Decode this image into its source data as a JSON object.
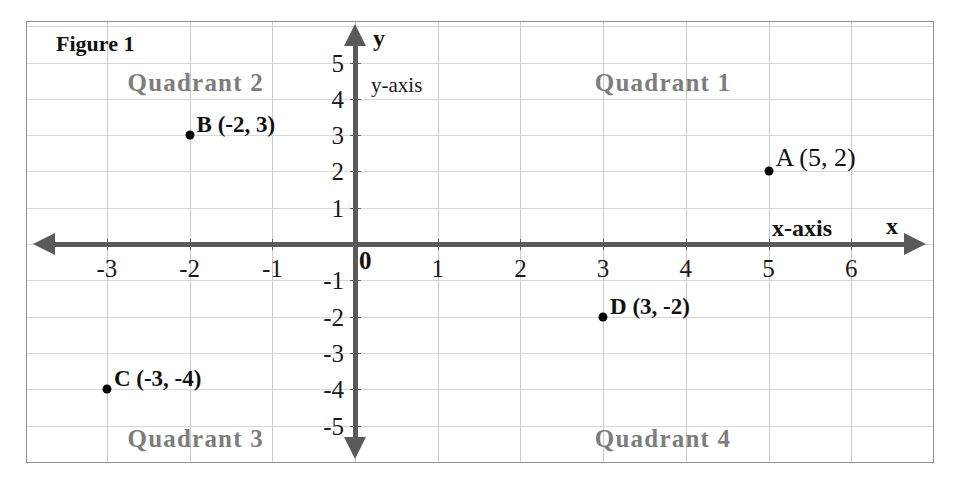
{
  "figure": {
    "title": "Figure 1"
  },
  "chart_data": {
    "type": "scatter",
    "title": "Figure 1",
    "xlabel": "x-axis",
    "ylabel": "y-axis",
    "x_axis_arrow_label": "x",
    "y_axis_arrow_label": "y",
    "xlim": [
      -3.95,
      7.0
    ],
    "ylim": [
      -6.1,
      6.1
    ],
    "grid": true,
    "origin_label": "0",
    "x_ticks": [
      {
        "value": -3,
        "label": "-3"
      },
      {
        "value": -2,
        "label": "-2"
      },
      {
        "value": -1,
        "label": "-1"
      },
      {
        "value": 1,
        "label": "1"
      },
      {
        "value": 2,
        "label": "2"
      },
      {
        "value": 3,
        "label": "3"
      },
      {
        "value": 4,
        "label": "4"
      },
      {
        "value": 5,
        "label": "5"
      },
      {
        "value": 6,
        "label": "6"
      }
    ],
    "y_ticks": [
      {
        "value": 5,
        "label": "5"
      },
      {
        "value": 4,
        "label": "4"
      },
      {
        "value": 3,
        "label": "3"
      },
      {
        "value": 2,
        "label": "2"
      },
      {
        "value": 1,
        "label": "1"
      },
      {
        "value": -1,
        "label": "-1"
      },
      {
        "value": -2,
        "label": "-2"
      },
      {
        "value": -3,
        "label": "-3"
      },
      {
        "value": -4,
        "label": "-4"
      },
      {
        "value": -5,
        "label": "-5"
      }
    ],
    "points": [
      {
        "name": "A",
        "x": 5,
        "y": 2,
        "label": "A (5, 2)",
        "quadrant": 1
      },
      {
        "name": "B",
        "x": -2,
        "y": 3,
        "label": "B (-2, 3)",
        "quadrant": 2
      },
      {
        "name": "C",
        "x": -3,
        "y": -4,
        "label": "C (-3, -4)",
        "quadrant": 3
      },
      {
        "name": "D",
        "x": 3,
        "y": -2,
        "label": "D (3, -2)",
        "quadrant": 4
      }
    ],
    "annotations": [
      {
        "text": "Quadrant 1",
        "x": 2.9,
        "y": 4.45
      },
      {
        "text": "Quadrant 2",
        "x": -2.75,
        "y": 4.45
      },
      {
        "text": "Quadrant 3",
        "x": -2.75,
        "y": -5.35
      },
      {
        "text": "Quadrant 4",
        "x": 2.9,
        "y": -5.35
      }
    ],
    "colors": {
      "axis": "#5a5a5a",
      "grid": "#cfcfcf",
      "point": "#000000",
      "quadrant_label": "#7d7d7d",
      "text": "#111111",
      "frame": "#8f8f8f",
      "background": "#ffffff"
    }
  }
}
